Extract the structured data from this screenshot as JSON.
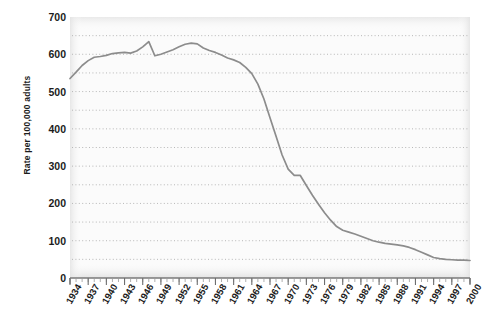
{
  "chart_data": {
    "type": "line",
    "title": "",
    "subtitle": "",
    "xlabel": "",
    "ylabel": "Rate per 100,000 adults",
    "xlim": [
      1934,
      2000
    ],
    "ylim": [
      0,
      700
    ],
    "y_ticks": [
      0,
      100,
      200,
      300,
      400,
      500,
      600,
      700
    ],
    "y_tick_labels": [
      "0",
      "100",
      "200",
      "300",
      "400",
      "500",
      "600",
      "700"
    ],
    "y_gridline_step": 50,
    "y_gridlines": [
      50,
      100,
      150,
      200,
      250,
      300,
      350,
      400,
      450,
      500,
      550,
      600,
      650
    ],
    "x_ticks": [
      1934,
      1937,
      1940,
      1943,
      1946,
      1949,
      1952,
      1955,
      1958,
      1961,
      1964,
      1967,
      1970,
      1973,
      1976,
      1979,
      1982,
      1985,
      1988,
      1991,
      1994,
      1997,
      2000
    ],
    "x_tick_labels": [
      "1934",
      "1937",
      "1940",
      "1943",
      "1946",
      "1949",
      "1952",
      "1955",
      "1958",
      "1961",
      "1964",
      "1967",
      "1970",
      "1973",
      "1976",
      "1979",
      "1982",
      "1985",
      "1988",
      "1991",
      "1994",
      "1997",
      "2000"
    ],
    "x_minor_tick_step": 1,
    "grid": true,
    "grid_style": "dotted",
    "legend": null,
    "legend_position": "none",
    "series": [
      {
        "name": "Rate per 100,000 adults",
        "color": "#8c8c8c",
        "x": [
          1934,
          1935,
          1936,
          1937,
          1938,
          1939,
          1940,
          1941,
          1942,
          1943,
          1944,
          1945,
          1946,
          1947,
          1948,
          1949,
          1950,
          1951,
          1952,
          1953,
          1954,
          1955,
          1956,
          1957,
          1958,
          1959,
          1960,
          1961,
          1962,
          1963,
          1964,
          1965,
          1966,
          1967,
          1968,
          1969,
          1970,
          1971,
          1972,
          1973,
          1974,
          1975,
          1976,
          1977,
          1978,
          1979,
          1980,
          1981,
          1982,
          1983,
          1984,
          1985,
          1986,
          1987,
          1988,
          1989,
          1990,
          1991,
          1992,
          1993,
          1994,
          1995,
          1996,
          1997,
          1998,
          1999,
          2000
        ],
        "values": [
          535,
          552,
          570,
          583,
          592,
          594,
          597,
          602,
          604,
          605,
          603,
          609,
          620,
          634,
          596,
          600,
          606,
          612,
          620,
          627,
          630,
          628,
          617,
          610,
          605,
          598,
          590,
          585,
          578,
          565,
          548,
          520,
          480,
          430,
          380,
          330,
          292,
          275,
          275,
          248,
          222,
          198,
          175,
          155,
          138,
          128,
          123,
          118,
          112,
          106,
          100,
          96,
          93,
          91,
          89,
          86,
          82,
          76,
          69,
          62,
          55,
          52,
          50,
          49,
          48,
          48,
          47
        ]
      }
    ]
  },
  "axis": {
    "y_axis_title": "Rate per 100,000 adults"
  }
}
